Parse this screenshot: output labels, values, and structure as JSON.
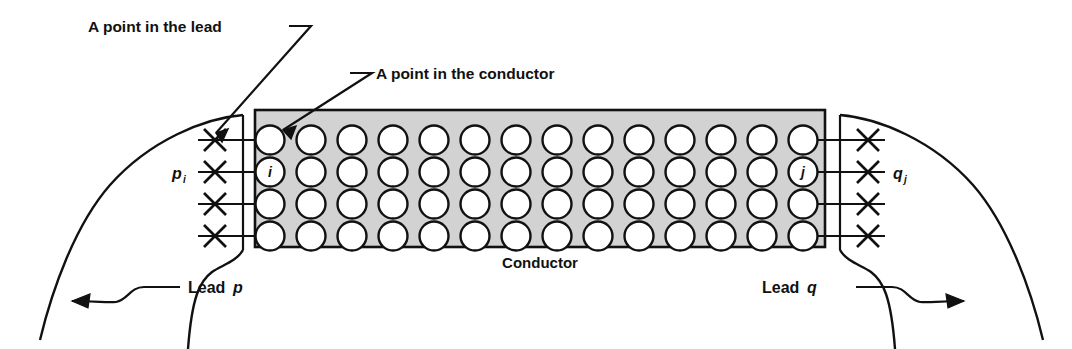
{
  "figure": {
    "background_color": "#ffffff",
    "ink_color": "#111111",
    "conductor_fill": "#d2d2d2"
  },
  "annotations": {
    "point_in_lead": "A point in the lead",
    "point_in_conductor": "A point in the conductor",
    "conductor_label": "Conductor",
    "lead_p_word": "Lead",
    "lead_p_letter": "p",
    "lead_q_word": "Lead",
    "lead_q_letter": "q",
    "terminal_p_letter": "p",
    "terminal_p_subscript": "i",
    "terminal_q_letter": "q",
    "terminal_q_subscript": "j",
    "node_i": "i",
    "node_j": "j"
  },
  "conductor": {
    "x": 255,
    "y": 110,
    "width": 570,
    "height": 137,
    "rows": 4,
    "columns": 14,
    "row_y": [
      140,
      172,
      204,
      236
    ],
    "col_x": [
      270,
      311,
      352,
      393,
      434,
      475,
      516,
      557,
      598,
      639,
      680,
      721,
      762,
      803
    ],
    "circle_radius": 14.5,
    "labeled_cells": [
      {
        "row": 1,
        "col": 0,
        "label": "i"
      },
      {
        "row": 1,
        "col": 13,
        "label": "j"
      }
    ]
  },
  "lead_p": {
    "terminals": 4,
    "x_mark_x": 215,
    "x_mark_half": 11,
    "bus_x": 243,
    "label_x": 190,
    "label_row": 1
  },
  "lead_q": {
    "terminals": 4,
    "x_mark_x": 868,
    "x_mark_half": 11,
    "bus_x": 840,
    "label_x": 888,
    "label_row": 1
  }
}
